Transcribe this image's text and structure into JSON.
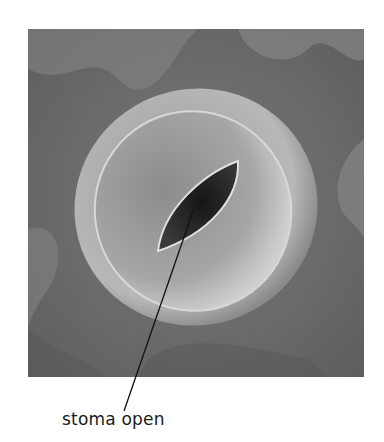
{
  "figure": {
    "label": "stoma open",
    "colors": {
      "background": "#ffffff",
      "surface": "#6e6e6e",
      "guard_cell": "#a8a8a8",
      "pore": "#1c1c1c",
      "label_text": "#1a1a1a"
    }
  }
}
